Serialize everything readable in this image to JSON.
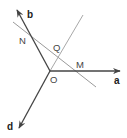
{
  "diagram": {
    "colors": {
      "ray": "#444444",
      "thin_line": "#9a9a9a",
      "label": "#333333"
    },
    "rays": [
      {
        "name": "a",
        "label": "a"
      },
      {
        "name": "b",
        "label": "b"
      },
      {
        "name": "d",
        "label": "d"
      }
    ],
    "points": [
      {
        "name": "O",
        "label": "O"
      },
      {
        "name": "N",
        "label": "N"
      },
      {
        "name": "M",
        "label": "M"
      },
      {
        "name": "Q",
        "label": "Q"
      }
    ],
    "lines": [
      {
        "name": "NM",
        "description": "line through N and M"
      },
      {
        "name": "OQ",
        "description": "line through O and Q"
      }
    ]
  }
}
